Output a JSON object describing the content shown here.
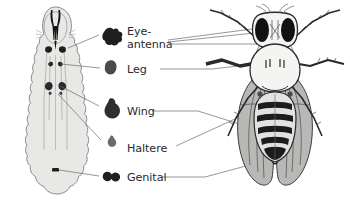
{
  "figure": {
    "background_color": "#ffffff",
    "text_color": "#2b2b2b",
    "line_color": "#6b6b6b"
  },
  "larva": {
    "name": "Drosophila third-instar larva (dorsal view)",
    "body_fill": "#e8e8e6",
    "body_outline": "#8a8a88",
    "trachea_color": "#b9b9b7",
    "mouth_hook_color": "#1a1a1a",
    "disc_color": "#2a2a2a"
  },
  "adult": {
    "name": "Adult Drosophila melanogaster (dorsal view)",
    "body_outline": "#2a2a2a",
    "eye_color": "#121212",
    "wing_fill": "#b5b5b3",
    "abdomen_band_color": "#1c1c1c",
    "thorax_fill": "#f2f2f0"
  },
  "discs": [
    {
      "id": "eye-antenna",
      "label_lines": [
        "Eye-",
        "antenna"
      ],
      "label_full": "Eye-antenna",
      "shape": "irregular-lobed",
      "color": "#1f1f1f"
    },
    {
      "id": "leg",
      "label_lines": [
        "Leg"
      ],
      "label_full": "Leg",
      "shape": "rounded-oval",
      "color": "#4a4a4a"
    },
    {
      "id": "wing",
      "label_lines": [
        "Wing"
      ],
      "label_full": "Wing",
      "shape": "pear-teardrop",
      "color": "#2e2e2e"
    },
    {
      "id": "haltere",
      "label_lines": [
        "Haltere"
      ],
      "label_full": "Haltere",
      "shape": "small-teardrop",
      "color": "#6a6a6a"
    },
    {
      "id": "genital",
      "label_lines": [
        "Genital"
      ],
      "label_full": "Genital",
      "shape": "bilobed-peanut",
      "color": "#1f1f1f"
    }
  ]
}
